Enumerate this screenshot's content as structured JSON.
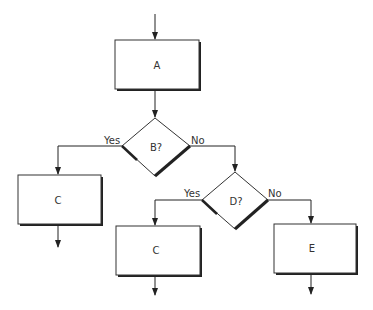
{
  "diagram": {
    "type": "flowchart",
    "nodes": [
      {
        "id": "A",
        "shape": "process",
        "label": "A"
      },
      {
        "id": "B",
        "shape": "decision",
        "label": "B?"
      },
      {
        "id": "C1",
        "shape": "process",
        "label": "C"
      },
      {
        "id": "D",
        "shape": "decision",
        "label": "D?"
      },
      {
        "id": "C2",
        "shape": "process",
        "label": "C"
      },
      {
        "id": "E",
        "shape": "process",
        "label": "E"
      }
    ],
    "edges": [
      {
        "from": "start",
        "to": "A",
        "label": ""
      },
      {
        "from": "A",
        "to": "B",
        "label": ""
      },
      {
        "from": "B",
        "to": "C1",
        "label": "Yes"
      },
      {
        "from": "B",
        "to": "D",
        "label": "No"
      },
      {
        "from": "D",
        "to": "C2",
        "label": "Yes"
      },
      {
        "from": "D",
        "to": "E",
        "label": "No"
      },
      {
        "from": "C1",
        "to": "exit",
        "label": ""
      },
      {
        "from": "C2",
        "to": "exit",
        "label": ""
      },
      {
        "from": "E",
        "to": "exit",
        "label": ""
      }
    ]
  },
  "labels": {
    "A": "A",
    "B": "B?",
    "C1": "C",
    "D": "D?",
    "C2": "C",
    "E": "E",
    "b_yes": "Yes",
    "b_no": "No",
    "d_yes": "Yes",
    "d_no": "No"
  }
}
